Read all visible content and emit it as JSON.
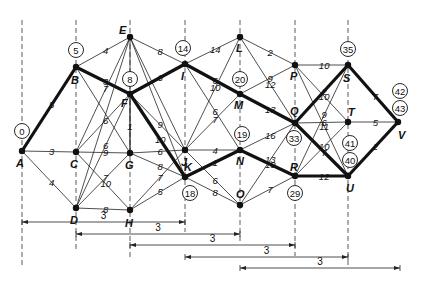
{
  "title": "",
  "nodes": [
    {
      "id": "A",
      "x": 22,
      "y": 151,
      "time": "0",
      "tx": 22,
      "ty": 131,
      "lx": 16,
      "ly": 167
    },
    {
      "id": "B",
      "x": 76,
      "y": 67,
      "time": "5",
      "tx": 76,
      "ty": 50,
      "lx": 71,
      "ly": 84
    },
    {
      "id": "C",
      "x": 76,
      "y": 152,
      "time": "",
      "lx": 70,
      "ly": 168
    },
    {
      "id": "D",
      "x": 76,
      "y": 208,
      "time": "",
      "lx": 70,
      "ly": 224
    },
    {
      "id": "E",
      "x": 130,
      "y": 37,
      "time": "",
      "lx": 119,
      "ly": 34
    },
    {
      "id": "F",
      "x": 130,
      "y": 94,
      "time": "8",
      "tx": 130,
      "ty": 79,
      "lx": 121,
      "ly": 107
    },
    {
      "id": "G",
      "x": 130,
      "y": 153,
      "time": "",
      "lx": 125,
      "ly": 169
    },
    {
      "id": "H",
      "x": 130,
      "y": 210,
      "time": "",
      "lx": 125,
      "ly": 227
    },
    {
      "id": "I",
      "x": 185,
      "y": 64,
      "time": "14",
      "tx": 183,
      "ty": 48,
      "lx": 181,
      "ly": 80
    },
    {
      "id": "J",
      "x": 185,
      "y": 150,
      "time": "",
      "lx": 181,
      "ly": 166
    },
    {
      "id": "K",
      "x": 185,
      "y": 177,
      "time": "18",
      "tx": 190,
      "ty": 193,
      "lx": 184,
      "ly": 171
    },
    {
      "id": "L",
      "x": 240,
      "y": 37,
      "time": "",
      "lx": 236,
      "ly": 52
    },
    {
      "id": "M",
      "x": 240,
      "y": 94,
      "time": "20",
      "tx": 240,
      "ty": 79,
      "lx": 234,
      "ly": 109
    },
    {
      "id": "N",
      "x": 240,
      "y": 150,
      "time": "19",
      "tx": 242,
      "ty": 134,
      "lx": 236,
      "ly": 165
    },
    {
      "id": "O",
      "x": 240,
      "y": 205,
      "time": "",
      "lx": 236,
      "ly": 198
    },
    {
      "id": "P",
      "x": 295,
      "y": 65,
      "time": "",
      "lx": 290,
      "ly": 80
    },
    {
      "id": "Q",
      "x": 295,
      "y": 123,
      "time": "33",
      "tx": 294,
      "ty": 138,
      "lx": 290,
      "ly": 115
    },
    {
      "id": "R",
      "x": 295,
      "y": 176,
      "time": "29",
      "tx": 295,
      "ty": 193,
      "lx": 290,
      "ly": 171
    },
    {
      "id": "S",
      "x": 348,
      "y": 65,
      "time": "35",
      "tx": 348,
      "ty": 49,
      "lx": 343,
      "ly": 82
    },
    {
      "id": "T",
      "x": 348,
      "y": 122,
      "time": "",
      "lx": 348,
      "ly": 116
    },
    {
      "id": "U",
      "x": 348,
      "y": 176,
      "time": "40",
      "tx": 350,
      "ty": 160,
      "lx": 346,
      "ly": 192
    },
    {
      "id": "V",
      "x": 398,
      "y": 122,
      "time": "",
      "lx": 398,
      "ly": 139
    }
  ],
  "extra_times": [
    {
      "label": "42",
      "x": 400,
      "y": 91
    },
    {
      "label": "43",
      "x": 400,
      "y": 108
    },
    {
      "label": "41",
      "x": 350,
      "y": 143
    }
  ],
  "edges": [
    {
      "from": "A",
      "to": "B",
      "w": "5",
      "critical": true
    },
    {
      "from": "A",
      "to": "C",
      "w": "3",
      "critical": false
    },
    {
      "from": "A",
      "to": "D",
      "w": "4",
      "critical": false
    },
    {
      "from": "B",
      "to": "E",
      "w": "4",
      "critical": false
    },
    {
      "from": "B",
      "to": "F",
      "w": "3",
      "critical": true
    },
    {
      "from": "B",
      "to": "G",
      "w": "",
      "critical": false
    },
    {
      "from": "C",
      "to": "E",
      "w": "7",
      "critical": false
    },
    {
      "from": "C",
      "to": "F",
      "w": "6",
      "critical": false
    },
    {
      "from": "C",
      "to": "G",
      "w": "9",
      "critical": false
    },
    {
      "from": "C",
      "to": "H",
      "w": "10",
      "critical": false
    },
    {
      "from": "D",
      "to": "F",
      "w": "6",
      "critical": false
    },
    {
      "from": "D",
      "to": "G",
      "w": "7",
      "critical": false
    },
    {
      "from": "D",
      "to": "H",
      "w": "8",
      "critical": false
    },
    {
      "from": "D",
      "to": "E",
      "w": "",
      "critical": false
    },
    {
      "from": "E",
      "to": "I",
      "w": "8",
      "critical": false
    },
    {
      "from": "E",
      "to": "J",
      "w": "",
      "critical": false
    },
    {
      "from": "E",
      "to": "K",
      "w": "",
      "critical": false
    },
    {
      "from": "E",
      "to": "G",
      "w": "",
      "critical": false
    },
    {
      "from": "F",
      "to": "I",
      "w": "6",
      "critical": true
    },
    {
      "from": "F",
      "to": "J",
      "w": "9",
      "critical": false
    },
    {
      "from": "F",
      "to": "K",
      "w": "10",
      "critical": true
    },
    {
      "from": "F",
      "to": "G",
      "w": "1",
      "critical": false
    },
    {
      "from": "G",
      "to": "J",
      "w": "6",
      "critical": false
    },
    {
      "from": "G",
      "to": "K",
      "w": "8",
      "critical": false
    },
    {
      "from": "H",
      "to": "J",
      "w": "7",
      "critical": false
    },
    {
      "from": "H",
      "to": "K",
      "w": "5",
      "critical": false
    },
    {
      "from": "I",
      "to": "L",
      "w": "14",
      "critical": false
    },
    {
      "from": "I",
      "to": "M",
      "w": "6",
      "critical": true
    },
    {
      "from": "I",
      "to": "N",
      "w": "6",
      "critical": false
    },
    {
      "from": "J",
      "to": "L",
      "w": "10",
      "critical": false
    },
    {
      "from": "J",
      "to": "M",
      "w": "7",
      "critical": false
    },
    {
      "from": "J",
      "to": "N",
      "w": "4",
      "critical": false
    },
    {
      "from": "J",
      "to": "O",
      "w": "6",
      "critical": false
    },
    {
      "from": "K",
      "to": "N",
      "w": "1",
      "critical": true
    },
    {
      "from": "K",
      "to": "O",
      "w": "8",
      "critical": false
    },
    {
      "from": "L",
      "to": "P",
      "w": "2",
      "critical": false
    },
    {
      "from": "L",
      "to": "Q",
      "w": "12",
      "critical": false
    },
    {
      "from": "M",
      "to": "P",
      "w": "9",
      "critical": false
    },
    {
      "from": "M",
      "to": "Q",
      "w": "13",
      "critical": true
    },
    {
      "from": "N",
      "to": "Q",
      "w": "16",
      "critical": false
    },
    {
      "from": "N",
      "to": "R",
      "w": "10",
      "critical": true
    },
    {
      "from": "O",
      "to": "Q",
      "w": "13",
      "critical": false
    },
    {
      "from": "O",
      "to": "R",
      "w": "7",
      "critical": false
    },
    {
      "from": "P",
      "to": "S",
      "w": "10",
      "critical": false
    },
    {
      "from": "P",
      "to": "T",
      "w": "10",
      "critical": false
    },
    {
      "from": "P",
      "to": "U",
      "w": "11",
      "critical": false
    },
    {
      "from": "Q",
      "to": "S",
      "w": "2",
      "critical": true
    },
    {
      "from": "Q",
      "to": "T",
      "w": "6",
      "critical": false
    },
    {
      "from": "Q",
      "to": "U",
      "w": "7",
      "critical": true
    },
    {
      "from": "R",
      "to": "S",
      "w": "9",
      "critical": false
    },
    {
      "from": "R",
      "to": "T",
      "w": "10",
      "critical": false
    },
    {
      "from": "R",
      "to": "U",
      "w": "12",
      "critical": true
    },
    {
      "from": "S",
      "to": "V",
      "w": "7",
      "critical": true
    },
    {
      "from": "T",
      "to": "V",
      "w": "5",
      "critical": false
    },
    {
      "from": "U",
      "to": "V",
      "w": "2",
      "critical": true
    }
  ],
  "guides": [
    {
      "x": 22,
      "y1": 20,
      "y2": 268
    },
    {
      "x": 76,
      "y1": 20,
      "y2": 250
    },
    {
      "x": 130,
      "y1": 20,
      "y2": 260
    },
    {
      "x": 185,
      "y1": 20,
      "y2": 232
    },
    {
      "x": 240,
      "y1": 20,
      "y2": 244
    },
    {
      "x": 295,
      "y1": 20,
      "y2": 256
    },
    {
      "x": 348,
      "y1": 20,
      "y2": 268
    }
  ],
  "spans": [
    {
      "x1": 22,
      "x2": 185,
      "y": 222,
      "label": "3"
    },
    {
      "x1": 76,
      "x2": 240,
      "y": 234,
      "label": "3"
    },
    {
      "x1": 130,
      "x2": 295,
      "y": 245,
      "label": "3"
    },
    {
      "x1": 185,
      "x2": 348,
      "y": 257,
      "label": "3"
    },
    {
      "x1": 240,
      "x2": 400,
      "y": 268,
      "label": "3"
    }
  ]
}
